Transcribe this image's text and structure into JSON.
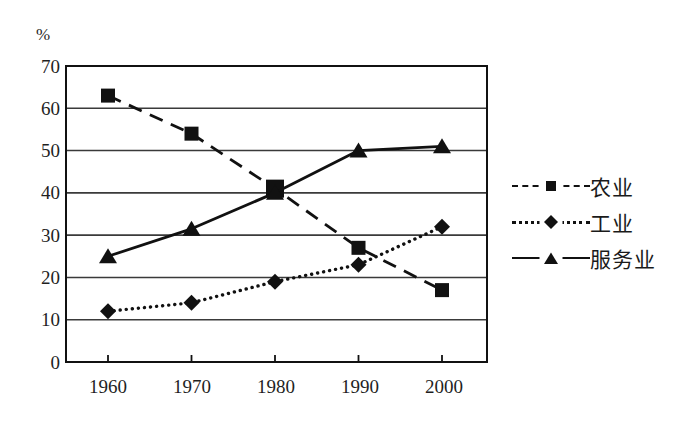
{
  "chart_data": {
    "type": "line",
    "title": "",
    "xlabel": "",
    "ylabel": "%",
    "unit_label": "%",
    "categories": [
      "1960",
      "1970",
      "1980",
      "1990",
      "2000"
    ],
    "x": [
      1960,
      1970,
      1980,
      1990,
      2000
    ],
    "ylim": [
      0,
      70
    ],
    "yticks": [
      0,
      10,
      20,
      30,
      40,
      50,
      60,
      70
    ],
    "ytick_labels": [
      "0",
      "10",
      "20",
      "30",
      "40",
      "50",
      "60",
      "70"
    ],
    "grid": true,
    "grid_axis": "y",
    "legend_position": "right",
    "series": [
      {
        "name": "农业",
        "values": [
          63,
          54,
          41,
          27,
          17
        ],
        "marker": "square",
        "linestyle": "dashed",
        "color": "#111111"
      },
      {
        "name": "工业",
        "values": [
          12,
          14,
          19,
          23,
          32
        ],
        "marker": "diamond",
        "linestyle": "dotted",
        "color": "#111111"
      },
      {
        "name": "服务业",
        "values": [
          25,
          31.5,
          40,
          50,
          51
        ],
        "marker": "triangle",
        "linestyle": "solid",
        "color": "#111111"
      }
    ]
  },
  "legend": {
    "items": [
      {
        "label": "农业",
        "marker": "square-marker",
        "linestyle": "dashed"
      },
      {
        "label": "工业",
        "marker": "diamond-marker",
        "linestyle": "dotted"
      },
      {
        "label": "服务业",
        "marker": "triangle-marker",
        "linestyle": "solid"
      }
    ]
  },
  "axes": {
    "unit": "%",
    "y_labels": [
      "70",
      "60",
      "50",
      "40",
      "30",
      "20",
      "10",
      "0"
    ],
    "x_labels": [
      "1960",
      "1970",
      "1980",
      "1990",
      "2000"
    ]
  },
  "colors": {
    "ink": "#111111",
    "grid": "#3a3a3a",
    "background": "#ffffff"
  }
}
